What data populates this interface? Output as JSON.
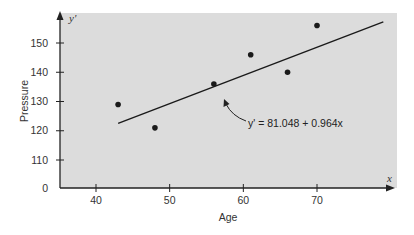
{
  "chart_data": {
    "type": "scatter",
    "title": "",
    "xlabel": "Age",
    "ylabel": "Pressure",
    "x_axis_symbol": "x",
    "y_axis_symbol": "y'",
    "xlim": [
      35,
      80
    ],
    "ylim": [
      105,
      160
    ],
    "y_axis_break": true,
    "x_ticks": [
      40,
      50,
      60,
      70
    ],
    "y_ticks": [
      0,
      110,
      120,
      130,
      140,
      150
    ],
    "grid": false,
    "background_color": "#dcdcdc",
    "point_color": "#1a1a1a",
    "series": [
      {
        "name": "Observed data",
        "x": [
          43,
          48,
          56,
          61,
          66,
          70
        ],
        "y": [
          129,
          121,
          136,
          146,
          140,
          156
        ]
      }
    ],
    "regression_line": {
      "equation_label": "y' = 81.048 + 0.964x",
      "intercept": 81.048,
      "slope": 0.964,
      "x_start": 43,
      "x_end": 79
    },
    "annotations": [
      {
        "text": "y' = 81.048 + 0.964x",
        "points_to": "regression line"
      }
    ]
  }
}
